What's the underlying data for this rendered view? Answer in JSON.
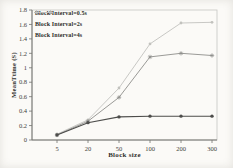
{
  "chart_data": {
    "type": "line",
    "categories": [
      "5",
      "20",
      "50",
      "100",
      "200",
      "300"
    ],
    "series": [
      {
        "name": "Block Interval=0.5s",
        "values": [
          0.07,
          0.24,
          0.32,
          0.33,
          0.33,
          0.33
        ],
        "color": "#4d4d4b",
        "marker": "circle"
      },
      {
        "name": "Block Interval=2s",
        "values": [
          0.07,
          0.26,
          0.59,
          1.15,
          1.2,
          1.17
        ],
        "color": "#8e8e8b",
        "marker": "star"
      },
      {
        "name": "Block Interval=4s",
        "values": [
          0.08,
          0.28,
          0.72,
          1.33,
          1.62,
          1.63
        ],
        "color": "#c2c2be",
        "marker": "dot"
      }
    ],
    "title": "",
    "xlabel": "Block size",
    "ylabel": "MeanTtime (S)",
    "ylim": [
      0,
      1.8
    ],
    "ytick_step": 0.2,
    "yticks": [
      "0",
      "0.2",
      "0.4",
      "0.6",
      "0.8",
      "1",
      "1.2",
      "1.4",
      "1.6",
      "1.8"
    ],
    "grid": false,
    "legend_position": "top-left"
  },
  "colors": {
    "background": "#fbfaf7",
    "frame": "#c6c6c2",
    "axis": "#73736f",
    "tick_text": "#3e3e3a"
  }
}
